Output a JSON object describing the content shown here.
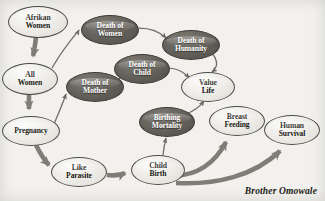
{
  "diagram": {
    "signature": "Brother Omowale",
    "background_color": "#f2f1ee",
    "light_node_color": "#eceae5",
    "dark_node_color": "#625f59",
    "edge_color": "#6e6b65",
    "nodes": [
      {
        "id": "afrikan-women",
        "label": "Afrikan\nWomen",
        "style": "light",
        "cx": 38,
        "cy": 22,
        "rx": 30,
        "ry": 16,
        "font_size": 7.6
      },
      {
        "id": "all-women",
        "label": "All\nWomen",
        "style": "light",
        "cx": 30,
        "cy": 79,
        "rx": 28,
        "ry": 16,
        "font_size": 7.6
      },
      {
        "id": "pregnancy",
        "label": "Pregnancy",
        "style": "light",
        "cx": 31,
        "cy": 131,
        "rx": 29,
        "ry": 15,
        "font_size": 7.6
      },
      {
        "id": "like-parasite",
        "label": "Like\nParasite",
        "style": "light",
        "cx": 79,
        "cy": 172,
        "rx": 28,
        "ry": 15,
        "font_size": 7.6
      },
      {
        "id": "child-birth",
        "label": "Child\nBirth",
        "style": "light",
        "cx": 158,
        "cy": 170,
        "rx": 27,
        "ry": 15,
        "font_size": 7.6
      },
      {
        "id": "death-of-women",
        "label": "Death of\nWomen",
        "style": "dark",
        "cx": 110,
        "cy": 30,
        "rx": 29,
        "ry": 15,
        "font_size": 7.6
      },
      {
        "id": "death-of-humanity",
        "label": "Death of\nHumanity",
        "style": "dark",
        "cx": 191,
        "cy": 45,
        "rx": 29,
        "ry": 15,
        "font_size": 7.6
      },
      {
        "id": "death-of-child",
        "label": "Death of\nChild",
        "style": "dark",
        "cx": 142,
        "cy": 69,
        "rx": 28,
        "ry": 15,
        "font_size": 7.6
      },
      {
        "id": "death-of-mother",
        "label": "Death of\nMother",
        "style": "dark",
        "cx": 95,
        "cy": 87,
        "rx": 29,
        "ry": 15,
        "font_size": 7.6
      },
      {
        "id": "value-life",
        "label": "Value\nLife",
        "style": "light",
        "cx": 208,
        "cy": 87,
        "rx": 27,
        "ry": 15,
        "font_size": 7.6
      },
      {
        "id": "birthing-mortality",
        "label": "Birthing\nMortality",
        "style": "dark",
        "cx": 167,
        "cy": 122,
        "rx": 28,
        "ry": 15,
        "font_size": 7.6
      },
      {
        "id": "breast-feeding",
        "label": "Breast\nFeeding",
        "style": "light",
        "cx": 237,
        "cy": 121,
        "rx": 28,
        "ry": 15,
        "font_size": 7.6
      },
      {
        "id": "human-survival",
        "label": "Human\nSurvival",
        "style": "light",
        "cx": 292,
        "cy": 130,
        "rx": 28,
        "ry": 15,
        "font_size": 7.6
      }
    ],
    "edges": [
      {
        "id": "afrikan-women-to-all-women",
        "from": "afrikan-women",
        "to": "all-women",
        "weight": "thick"
      },
      {
        "id": "all-women-to-death-of-women",
        "from": "all-women",
        "to": "death-of-women",
        "weight": "thin"
      },
      {
        "id": "all-women-to-pregnancy",
        "from": "all-women",
        "to": "pregnancy",
        "weight": "thick"
      },
      {
        "id": "pregnancy-to-death-of-mother",
        "from": "pregnancy",
        "to": "death-of-mother",
        "weight": "thin"
      },
      {
        "id": "pregnancy-to-like-parasite",
        "from": "pregnancy",
        "to": "like-parasite",
        "weight": "thick"
      },
      {
        "id": "like-parasite-to-child-birth",
        "from": "like-parasite",
        "to": "child-birth",
        "weight": "thick"
      },
      {
        "id": "death-of-women-to-death-of-humanity",
        "from": "death-of-women",
        "to": "death-of-humanity",
        "weight": "thin"
      },
      {
        "id": "death-of-mother-to-death-of-child",
        "from": "death-of-mother",
        "to": "death-of-child",
        "weight": "thin"
      },
      {
        "id": "death-of-child-to-value-life",
        "from": "death-of-child",
        "to": "value-life",
        "weight": "thin"
      },
      {
        "id": "death-of-humanity-to-value-life",
        "from": "death-of-humanity",
        "to": "value-life",
        "weight": "thin"
      },
      {
        "id": "birthing-mortality-to-value-life",
        "from": "birthing-mortality",
        "to": "value-life",
        "weight": "thin"
      },
      {
        "id": "child-birth-to-birthing-mortality",
        "from": "child-birth",
        "to": "birthing-mortality",
        "weight": "thin"
      },
      {
        "id": "child-birth-to-breast-feeding",
        "from": "child-birth",
        "to": "breast-feeding",
        "weight": "thick"
      },
      {
        "id": "child-birth-to-human-survival",
        "from": "child-birth",
        "to": "human-survival",
        "weight": "thick"
      }
    ]
  }
}
